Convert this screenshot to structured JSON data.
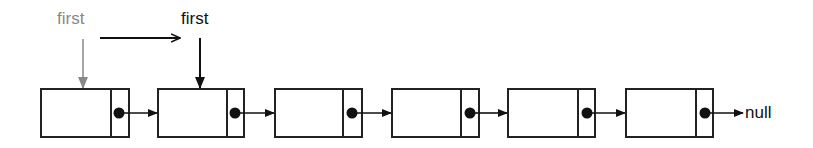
{
  "diagram": {
    "type": "singly-linked-list",
    "pointers": {
      "old_first": {
        "label": "first",
        "color": "#888888"
      },
      "new_first": {
        "label": "first",
        "color": "#111111"
      }
    },
    "nodes": [
      {
        "index": 0
      },
      {
        "index": 1
      },
      {
        "index": 2
      },
      {
        "index": 3
      },
      {
        "index": 4
      },
      {
        "index": 5
      }
    ],
    "terminator": {
      "label": "null"
    },
    "colors": {
      "stroke": "#222222",
      "faded": "#888888",
      "background": "#ffffff"
    }
  }
}
